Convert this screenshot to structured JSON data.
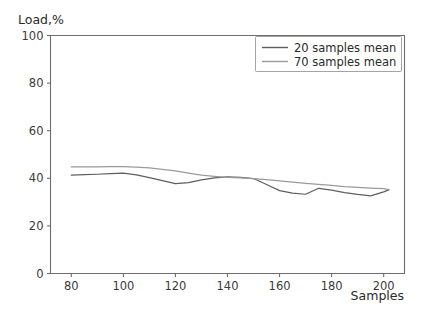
{
  "chart_data": {
    "type": "line",
    "title": "",
    "xlabel": "Samples",
    "ylabel": "Load,%",
    "xlim": [
      72,
      208
    ],
    "ylim": [
      0,
      100
    ],
    "xticks": [
      80,
      100,
      120,
      140,
      160,
      180,
      200
    ],
    "yticks": [
      0,
      20,
      40,
      60,
      80,
      100
    ],
    "xticklabels": [
      "80",
      "100",
      "120",
      "140",
      "160",
      "180",
      "200"
    ],
    "yticklabels": [
      "0",
      "20",
      "40",
      "60",
      "80",
      "100"
    ],
    "grid": false,
    "legend_position": "upper right",
    "series": [
      {
        "name": "20 samples mean",
        "color": "#5f5f5f",
        "x": [
          80,
          85,
          90,
          95,
          100,
          105,
          110,
          115,
          120,
          125,
          130,
          135,
          140,
          145,
          150,
          155,
          160,
          165,
          170,
          175,
          180,
          185,
          190,
          195,
          200,
          202
        ],
        "values": [
          41.3,
          41.5,
          41.7,
          42.0,
          42.2,
          41.4,
          40.3,
          39.0,
          37.8,
          38.2,
          39.3,
          40.2,
          40.6,
          40.4,
          39.9,
          37.4,
          34.8,
          33.8,
          33.3,
          35.8,
          35.0,
          34.0,
          33.2,
          32.6,
          34.3,
          35.1
        ]
      },
      {
        "name": "70 samples mean",
        "color": "#9a9a9a",
        "x": [
          80,
          85,
          90,
          95,
          100,
          105,
          110,
          115,
          120,
          125,
          130,
          135,
          140,
          145,
          150,
          155,
          160,
          165,
          170,
          175,
          180,
          185,
          190,
          195,
          200,
          202
        ],
        "values": [
          44.8,
          44.8,
          44.8,
          44.9,
          44.9,
          44.7,
          44.4,
          43.8,
          43.1,
          42.2,
          41.3,
          40.8,
          40.4,
          40.2,
          39.9,
          39.4,
          38.9,
          38.4,
          37.9,
          37.4,
          37.0,
          36.5,
          36.2,
          35.9,
          35.7,
          35.2
        ]
      }
    ]
  },
  "legend": {
    "entries": [
      {
        "label": "20 samples mean"
      },
      {
        "label": "70 samples mean"
      }
    ]
  },
  "axes": {
    "ylabel_text": "Load,%",
    "xlabel_text": "Samples"
  }
}
